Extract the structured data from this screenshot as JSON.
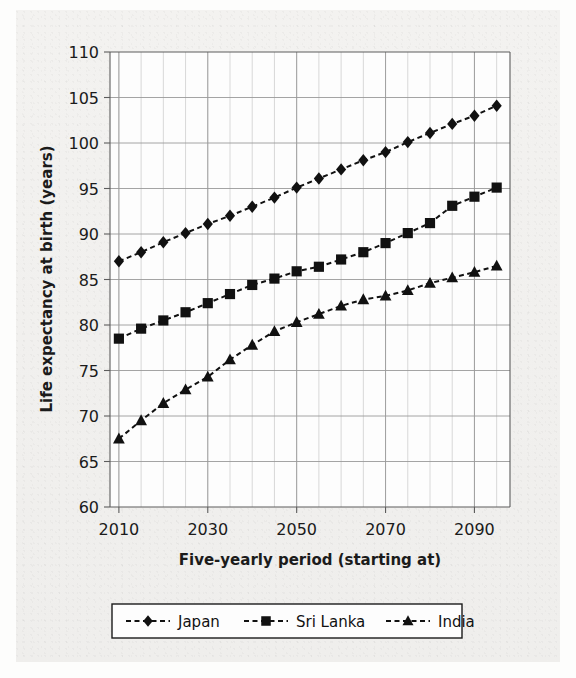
{
  "figure": {
    "background_color": "#f1f0ee",
    "plot_background_color": "#fdfdfd",
    "ink_color": "#111111",
    "grid_color": "#9a9a9a",
    "minor_grid_color": "#c8c8c8"
  },
  "chart_data": {
    "type": "line",
    "title": "",
    "xlabel": "Five-yearly period (starting at)",
    "ylabel": "Life expectancy at birth (years)",
    "xlim": [
      2008,
      2098
    ],
    "ylim": [
      60,
      110
    ],
    "ytick_labels": [
      "60",
      "65",
      "70",
      "75",
      "80",
      "85",
      "90",
      "95",
      "100",
      "105",
      "110"
    ],
    "yticks": [
      60,
      65,
      70,
      75,
      80,
      85,
      90,
      95,
      100,
      105,
      110
    ],
    "xtick_labels": [
      "2010",
      "2030",
      "2050",
      "2070",
      "2090"
    ],
    "xticks": [
      2010,
      2030,
      2050,
      2070,
      2090
    ],
    "minor_xtick_step": 5,
    "grid": true,
    "legend_position": "below",
    "x": [
      2010,
      2015,
      2020,
      2025,
      2030,
      2035,
      2040,
      2045,
      2050,
      2055,
      2060,
      2065,
      2070,
      2075,
      2080,
      2085,
      2090,
      2095
    ],
    "series": [
      {
        "name": "Japan",
        "marker": "diamond",
        "linestyle": "dashed",
        "color": "#111111",
        "values": [
          87.0,
          88.0,
          89.1,
          90.1,
          91.1,
          92.0,
          93.0,
          94.0,
          95.1,
          96.1,
          97.1,
          98.1,
          99.0,
          100.1,
          101.1,
          102.1,
          103.0,
          104.1
        ]
      },
      {
        "name": "Sri Lanka",
        "marker": "square",
        "linestyle": "dashed",
        "color": "#111111",
        "values": [
          78.5,
          79.6,
          80.5,
          81.4,
          82.4,
          83.4,
          84.4,
          85.1,
          85.9,
          86.4,
          87.2,
          88.0,
          89.0,
          90.1,
          91.2,
          93.1,
          94.1,
          95.1
        ]
      },
      {
        "name": "India",
        "marker": "triangle",
        "linestyle": "dashed",
        "color": "#111111",
        "values": [
          67.5,
          69.5,
          71.4,
          72.9,
          74.3,
          76.2,
          77.8,
          79.3,
          80.3,
          81.2,
          82.1,
          82.8,
          83.2,
          83.8,
          84.6,
          85.2,
          85.8,
          86.5
        ]
      }
    ]
  },
  "legend": {
    "entries": [
      {
        "label": "Japan",
        "marker": "diamond"
      },
      {
        "label": "Sri Lanka",
        "marker": "square"
      },
      {
        "label": "India",
        "marker": "triangle"
      }
    ]
  }
}
